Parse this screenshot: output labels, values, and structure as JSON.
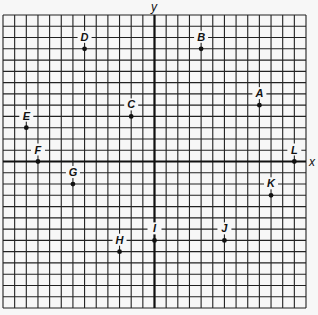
{
  "chart_data": {
    "type": "scatter",
    "title": "",
    "xlabel": "x",
    "ylabel": "y",
    "xlim": [
      -13,
      13
    ],
    "ylim": [
      -13,
      13
    ],
    "grid": true,
    "grid_step": 1,
    "tick_labels": false,
    "points": [
      {
        "label": "A",
        "x": 9,
        "y": 5
      },
      {
        "label": "B",
        "x": 4,
        "y": 10
      },
      {
        "label": "C",
        "x": -2,
        "y": 4
      },
      {
        "label": "D",
        "x": -6,
        "y": 10
      },
      {
        "label": "E",
        "x": -11,
        "y": 3
      },
      {
        "label": "F",
        "x": -10,
        "y": 0
      },
      {
        "label": "G",
        "x": -7,
        "y": -2
      },
      {
        "label": "H",
        "x": -3,
        "y": -8
      },
      {
        "label": "I",
        "x": 0,
        "y": -7
      },
      {
        "label": "J",
        "x": 6,
        "y": -7
      },
      {
        "label": "K",
        "x": 10,
        "y": -3
      },
      {
        "label": "L",
        "x": 12,
        "y": 0
      }
    ]
  },
  "axes": {
    "x_label": "x",
    "y_label": "y"
  },
  "colors": {
    "background": "#f7f7f7",
    "grid": "#222222",
    "axis": "#111111",
    "point": "#111111"
  }
}
